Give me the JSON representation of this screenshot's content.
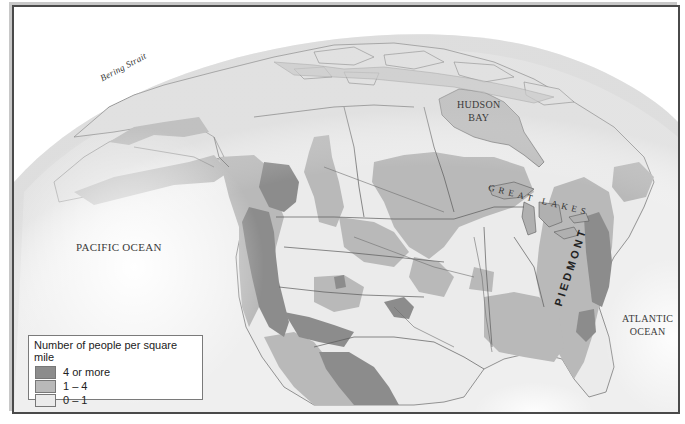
{
  "map": {
    "type": "thematic-choropleth",
    "subject": "Population density of North America",
    "labels": {
      "bering_strait": "Bering Strait",
      "hudson_bay_line1": "HUDSON",
      "hudson_bay_line2": "BAY",
      "pacific_ocean": "PACIFIC OCEAN",
      "atlantic_ocean_line1": "ATLANTIC",
      "atlantic_ocean_line2": "OCEAN",
      "great_lakes": "GREAT LAKES",
      "piedmont": "PIEDMONT"
    },
    "colors": {
      "ocean": "#ffffff",
      "globe_edge": "#d8d8d8",
      "low": "#ebebeb",
      "medium": "#b9b9b9",
      "high": "#8c8c8c",
      "water": "#b3b3b3",
      "border": "#5a5a5a"
    }
  },
  "legend": {
    "title": "Number of people per square mile",
    "items": [
      {
        "label": "4 or more",
        "color": "#8c8c8c"
      },
      {
        "label": "1 – 4",
        "color": "#b9b9b9"
      },
      {
        "label": "0 – 1",
        "color": "#ebebeb"
      }
    ]
  }
}
